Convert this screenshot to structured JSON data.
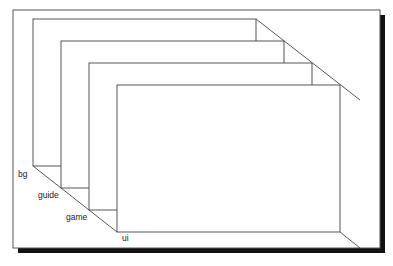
{
  "figure": {
    "kind": "layered-plane-diagram",
    "projection": "oblique",
    "frame": {
      "border_color": "#555555",
      "shadow_color": "#111111",
      "background_color": "#ffffff",
      "x": 13,
      "y": 10,
      "width": 367,
      "height": 238,
      "shadow_offset": 5
    },
    "stroke_color": "#444444",
    "plane_fill": "#ffffff",
    "depth_step": {
      "dx": 28,
      "dy": 22
    },
    "planes": [
      {
        "id": "plane-bg",
        "label": "bg",
        "order": 1,
        "top_left_x": 33,
        "top_left_y": 19,
        "width": 223,
        "height": 147,
        "label_x": 18,
        "label_y": 177
      },
      {
        "id": "plane-guide",
        "label": "guide",
        "order": 2,
        "top_left_x": 61,
        "top_left_y": 41,
        "width": 223,
        "height": 147,
        "label_x": 38,
        "label_y": 198
      },
      {
        "id": "plane-game",
        "label": "game",
        "order": 3,
        "top_left_x": 89,
        "top_left_y": 63,
        "width": 223,
        "height": 147,
        "label_x": 66,
        "label_y": 220
      },
      {
        "id": "plane-ui",
        "label": "ui",
        "order": 4,
        "top_left_x": 117,
        "top_left_y": 85,
        "width": 223,
        "height": 147,
        "label_x": 122,
        "label_y": 241
      }
    ],
    "connector_lines": [
      {
        "id": "connector-top",
        "x1": 33,
        "y1": 19,
        "x2": 117,
        "y2": 85
      },
      {
        "id": "connector-bottom",
        "x1": 33,
        "y1": 166,
        "x2": 117,
        "y2": 232
      },
      {
        "id": "connector-top-right",
        "x1": 256,
        "y1": 19,
        "x2": 360,
        "y2": 100
      },
      {
        "id": "connector-bottom-right",
        "x1": 340,
        "y1": 232,
        "x2": 360,
        "y2": 248
      }
    ]
  }
}
